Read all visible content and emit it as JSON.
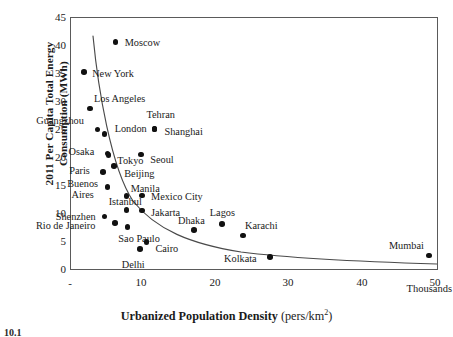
{
  "figure": {
    "caption_partial": "10.1",
    "background": "#ffffff",
    "point_color": "#111111",
    "frame_color": "#5a5a5a",
    "trend_color": "#4a4a4a"
  },
  "axes": {
    "y_title_line1": "2011 Per Capita Total Energy",
    "y_title_line2": "Consumption (MWh)",
    "x_title_bold": "Urbanized Population Density",
    "x_title_units_open": " (pers/km",
    "x_title_units_sup": "2",
    "x_title_units_close": ")",
    "x_scale_note": "Thousands",
    "y_ticks": [
      "45",
      "40",
      "35",
      "30",
      "25",
      "20",
      "15",
      "10",
      "5",
      "0"
    ],
    "x_ticks": [
      "-",
      "10",
      "20",
      "30",
      "40",
      "50"
    ]
  },
  "chart_data": {
    "type": "scatter",
    "title": "",
    "xlabel": "Urbanized Population Density (pers/km2)",
    "ylabel": "2011 Per Capita Total Energy Consumption (MWh)",
    "xlim": [
      0,
      50
    ],
    "ylim": [
      0,
      45
    ],
    "x_unit": "thousands of persons per km2",
    "y_unit": "MWh",
    "grid": false,
    "legend": null,
    "trendline": {
      "present": true,
      "shape": "hyperbolic-decline",
      "description": "steeply declining curve through cluster, flattening toward right"
    },
    "points": [
      {
        "city": "Moscow",
        "x": 6.1,
        "y": 40.7,
        "label_pos": "right"
      },
      {
        "city": "New York",
        "x": 1.8,
        "y": 35.3,
        "label_pos": "right"
      },
      {
        "city": "Los Angeles",
        "x": 2.6,
        "y": 28.8,
        "label_pos": "above-right"
      },
      {
        "city": "Guangzhou",
        "x": 3.6,
        "y": 25.0,
        "label_pos": "above-left"
      },
      {
        "city": "Tehran",
        "x": 11.4,
        "y": 25.1,
        "label_pos": "above"
      },
      {
        "city": "Shanghai",
        "x": 11.4,
        "y": 25.1,
        "label_pos": "right"
      },
      {
        "city": "London",
        "x": 4.6,
        "y": 24.2,
        "label_pos": "right"
      },
      {
        "city": "Osaka",
        "x": 5.0,
        "y": 20.7,
        "label_pos": "left"
      },
      {
        "city": "Tokyo",
        "x": 5.1,
        "y": 20.4,
        "label_pos": "right"
      },
      {
        "city": "Seoul",
        "x": 9.6,
        "y": 20.5,
        "label_pos": "right"
      },
      {
        "city": "Paris",
        "x": 4.4,
        "y": 17.4,
        "label_pos": "left"
      },
      {
        "city": "Beijing",
        "x": 5.9,
        "y": 18.5,
        "label_pos": "right"
      },
      {
        "city": "Buenos Aires",
        "x": 5.0,
        "y": 14.7,
        "label_pos": "left-two-line"
      },
      {
        "city": "Manila",
        "x": 7.6,
        "y": 13.1,
        "label_pos": "above-right"
      },
      {
        "city": "Mexico City",
        "x": 9.7,
        "y": 13.2,
        "label_pos": "right"
      },
      {
        "city": "Shenzhen",
        "x": 4.6,
        "y": 9.4,
        "label_pos": "left"
      },
      {
        "city": "Istanbul",
        "x": 7.6,
        "y": 10.6,
        "label_pos": "above"
      },
      {
        "city": "Jakarta",
        "x": 9.7,
        "y": 10.5,
        "label_pos": "right"
      },
      {
        "city": "Rio de Janeiro",
        "x": 6.0,
        "y": 8.3,
        "label_pos": "left"
      },
      {
        "city": "Sao Paulo",
        "x": 7.7,
        "y": 7.5,
        "label_pos": "below"
      },
      {
        "city": "Dhaka",
        "x": 16.8,
        "y": 7.0,
        "label_pos": "above"
      },
      {
        "city": "Lagos",
        "x": 20.6,
        "y": 8.1,
        "label_pos": "above"
      },
      {
        "city": "Karachi",
        "x": 23.5,
        "y": 6.0,
        "label_pos": "above-right"
      },
      {
        "city": "Cairo",
        "x": 10.3,
        "y": 4.8,
        "label_pos": "right"
      },
      {
        "city": "Delhi",
        "x": 9.4,
        "y": 3.6,
        "label_pos": "below-left"
      },
      {
        "city": "Kolkata",
        "x": 27.2,
        "y": 2.1,
        "label_pos": "left"
      },
      {
        "city": "Mumbai",
        "x": 48.9,
        "y": 2.4,
        "label_pos": "above-left"
      }
    ]
  }
}
